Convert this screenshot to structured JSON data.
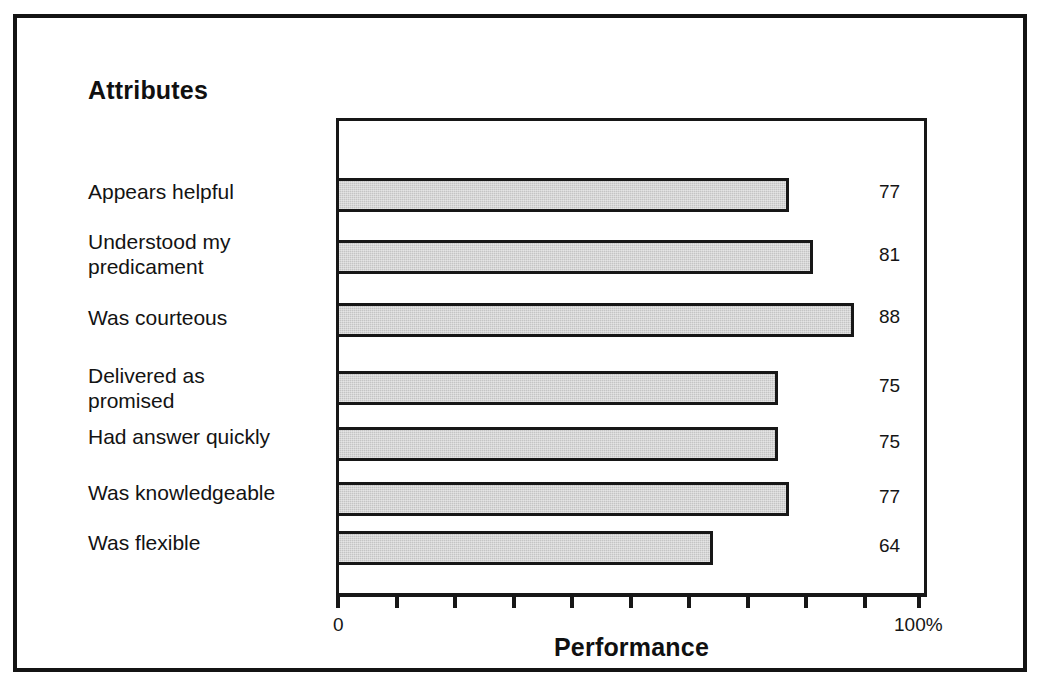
{
  "frame": {
    "border_color": "#141414"
  },
  "chart_data": {
    "type": "bar",
    "orientation": "horizontal",
    "title": "Attributes",
    "xlabel": "Performance",
    "ylabel": "Attributes",
    "xlim": [
      0,
      100
    ],
    "x_tick_values": [
      0,
      10,
      20,
      30,
      40,
      50,
      60,
      70,
      80,
      90,
      100
    ],
    "x_tick_labels": {
      "min": "0",
      "max": "100%"
    },
    "grid": false,
    "legend": null,
    "bar_fill_color": "#c4c4c4",
    "bar_border_color": "#171717",
    "categories": [
      "Appears helpful",
      "Understood my\npredicament",
      "Was courteous",
      "Delivered as\npromised",
      "Had answer quickly",
      "Was knowledgeable",
      "Was flexible"
    ],
    "values": [
      77,
      81,
      88,
      75,
      75,
      77,
      64
    ],
    "value_labels": [
      "77",
      "81",
      "88",
      "75",
      "75",
      "77",
      "64"
    ]
  }
}
